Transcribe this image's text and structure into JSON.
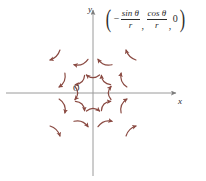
{
  "figure": {
    "title": "",
    "kind": "vector-field-plot",
    "background_color": "#ffffff",
    "axis_color": "#9a9a9a",
    "arrow_color": "#8a4a42",
    "label_color": "#2b2b2b"
  },
  "formula": {
    "open_paren": "(",
    "close_paren": ")",
    "minus": "−",
    "term1_numerator": "sin θ",
    "term1_denominator": "r",
    "separator1": ",",
    "term2_numerator": "cos θ",
    "term2_denominator": "r",
    "separator2": ",",
    "term3": "0",
    "plain": "(−sin θ / r, cos θ / r, 0)"
  },
  "axes": {
    "x_label": "x",
    "y_label": "y",
    "origin_label": "O",
    "origin_px": {
      "x": 93,
      "y": 93
    },
    "x_axis": {
      "x1": 6,
      "y1": 93,
      "x2": 180,
      "y2": 93,
      "arrow_end": "right"
    },
    "y_axis": {
      "x1": 93,
      "y1": 176,
      "x2": 93,
      "y2": 7,
      "arrow_end": "up"
    }
  },
  "chart_data": {
    "type": "scatter",
    "xlabel": "x",
    "ylabel": "y",
    "grid": false,
    "legend": null,
    "annotations": [
      "(−sin θ / r, cos θ / r, 0)"
    ],
    "rings": [
      {
        "radius_px": 18,
        "count": 8,
        "start_angle_deg": 0,
        "arrow_len_px": 13,
        "curve": 0.42
      },
      {
        "radius_px": 34,
        "count": 8,
        "start_angle_deg": 22,
        "arrow_len_px": 15,
        "curve": 0.34
      },
      {
        "radius_px": 54,
        "count": 4,
        "start_angle_deg": 45,
        "arrow_len_px": 14,
        "curve": 0.26
      }
    ],
    "vectors": [
      {
        "x": 111,
        "y": 93,
        "angle_deg": 0,
        "r": 18
      },
      {
        "x": 106,
        "y": 80,
        "angle_deg": 45,
        "r": 18
      },
      {
        "x": 93,
        "y": 75,
        "angle_deg": 90,
        "r": 18
      },
      {
        "x": 80,
        "y": 80,
        "angle_deg": 135,
        "r": 18
      },
      {
        "x": 75,
        "y": 93,
        "angle_deg": 180,
        "r": 18
      },
      {
        "x": 80,
        "y": 106,
        "angle_deg": 225,
        "r": 18
      },
      {
        "x": 93,
        "y": 111,
        "angle_deg": 270,
        "r": 18
      },
      {
        "x": 106,
        "y": 106,
        "angle_deg": 315,
        "r": 18
      },
      {
        "x": 124,
        "y": 80,
        "angle_deg": 22,
        "r": 34
      },
      {
        "x": 105,
        "y": 62,
        "angle_deg": 67,
        "r": 34
      },
      {
        "x": 81,
        "y": 62,
        "angle_deg": 112,
        "r": 34
      },
      {
        "x": 62,
        "y": 80,
        "angle_deg": 157,
        "r": 34
      },
      {
        "x": 62,
        "y": 106,
        "angle_deg": 202,
        "r": 34
      },
      {
        "x": 81,
        "y": 124,
        "angle_deg": 247,
        "r": 34
      },
      {
        "x": 105,
        "y": 124,
        "angle_deg": 292,
        "r": 34
      },
      {
        "x": 124,
        "y": 106,
        "angle_deg": 337,
        "r": 34
      },
      {
        "x": 131,
        "y": 55,
        "angle_deg": 45,
        "r": 54
      },
      {
        "x": 55,
        "y": 55,
        "angle_deg": 135,
        "r": 54
      },
      {
        "x": 55,
        "y": 131,
        "angle_deg": 225,
        "r": 54
      },
      {
        "x": 131,
        "y": 131,
        "angle_deg": 315,
        "r": 54
      }
    ]
  }
}
